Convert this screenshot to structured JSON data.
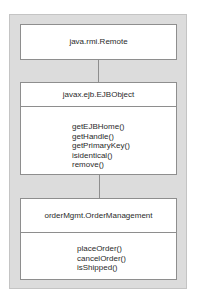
{
  "diagram": {
    "type": "uml-class-hierarchy",
    "boxes": [
      {
        "name": "java.rmi.Remote",
        "methods": []
      },
      {
        "name": "javax.ejb.EJBObject",
        "methods": [
          "getEJBHome()",
          "getHandle()",
          "getPrimaryKey()",
          "isidentical()",
          "remove()"
        ]
      },
      {
        "name": "orderMgmt.OrderManagement",
        "methods": [
          "placeOrder()",
          "cancelOrder()",
          "isShipped()"
        ]
      }
    ],
    "edges": [
      {
        "from": "javax.ejb.EJBObject",
        "to": "java.rmi.Remote"
      },
      {
        "from": "orderMgmt.OrderManagement",
        "to": "javax.ejb.EJBObject"
      }
    ]
  },
  "colors": {
    "panel": "#dcdcdc",
    "box": "#ffffff",
    "line": "#8e8e8e",
    "text": "#2a2a2a"
  }
}
